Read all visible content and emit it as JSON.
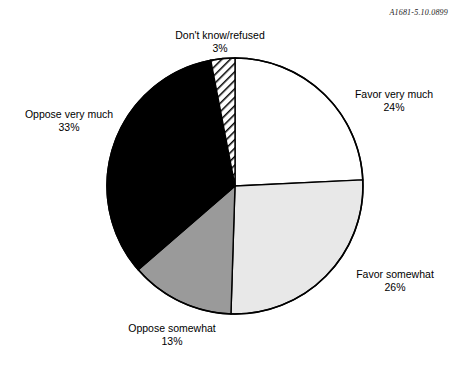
{
  "stamp": {
    "code": "A1681-5.10.0899"
  },
  "chart_data": {
    "type": "pie",
    "title": "",
    "subtitle": "",
    "xlabel": "",
    "ylabel": "",
    "legend_position": "none",
    "grid": false,
    "units": "percent",
    "start_angle_deg": 0,
    "direction": "clockwise",
    "center": {
      "x": 235,
      "y": 186
    },
    "radius": 128,
    "total": 99,
    "labels": [
      "Favor very much",
      "Favor somewhat",
      "Oppose somewhat",
      "Oppose very much",
      "Don't know/refused"
    ],
    "values": [
      24,
      26,
      13,
      33,
      3
    ],
    "slices": [
      {
        "label": "Favor very much",
        "value": 24,
        "value_text": "24%",
        "fill": "#ffffff",
        "pattern": "solid",
        "stroke": "#000000",
        "label_position": "right"
      },
      {
        "label": "Favor somewhat",
        "value": 26,
        "value_text": "26%",
        "fill": "#e8e8e8",
        "pattern": "solid",
        "stroke": "#000000",
        "label_position": "right"
      },
      {
        "label": "Oppose somewhat",
        "value": 13,
        "value_text": "13%",
        "fill": "#9a9a9a",
        "pattern": "solid",
        "stroke": "#000000",
        "label_position": "bottom"
      },
      {
        "label": "Oppose very much",
        "value": 33,
        "value_text": "33%",
        "fill": "#000000",
        "pattern": "solid",
        "stroke": "#000000",
        "label_position": "left"
      },
      {
        "label": "Don't know/refused",
        "value": 3,
        "value_text": "3%",
        "fill": "#ffffff",
        "pattern": "diagonal-hatch",
        "stroke": "#000000",
        "label_position": "top"
      }
    ]
  }
}
